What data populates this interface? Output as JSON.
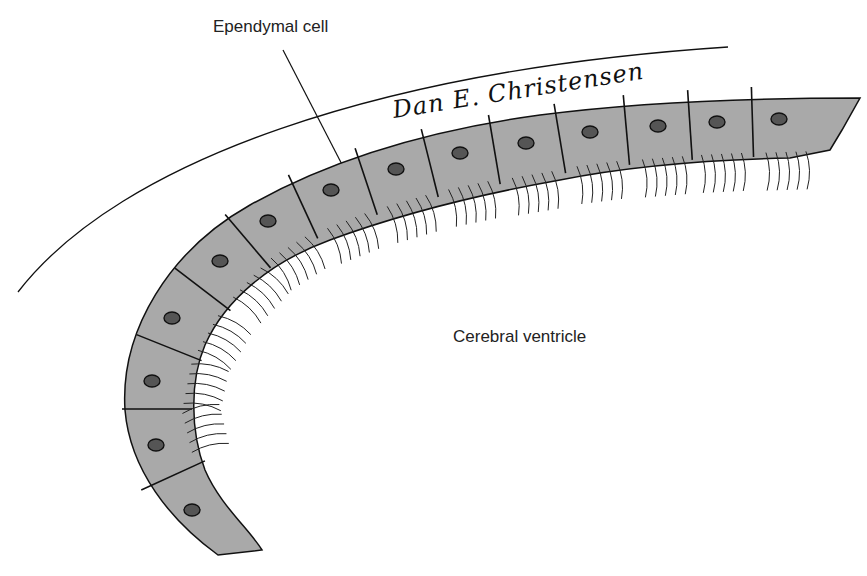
{
  "figure": {
    "labels": {
      "ependymal_cell": "Ependymal cell",
      "cerebral_ventricle": "Cerebral ventricle"
    },
    "signature": "Dan E. Christensen",
    "colors": {
      "cell_fill": "#a9a9a9",
      "outline": "#111111",
      "nucleus": "#555555",
      "background": "#ffffff"
    },
    "cells": [
      {
        "cx": 190,
        "cy": 510,
        "nx": 192,
        "ny": 510
      },
      {
        "cx": 158,
        "cy": 440,
        "nx": 156,
        "ny": 445
      },
      {
        "cx": 158,
        "cy": 378,
        "nx": 152,
        "ny": 381
      },
      {
        "cx": 182,
        "cy": 318,
        "nx": 172,
        "ny": 318
      },
      {
        "cx": 225,
        "cy": 262,
        "nx": 220,
        "ny": 261
      },
      {
        "cx": 272,
        "cy": 222,
        "nx": 268,
        "ny": 221
      },
      {
        "cx": 335,
        "cy": 193,
        "nx": 331,
        "ny": 190
      },
      {
        "cx": 398,
        "cy": 172,
        "nx": 396,
        "ny": 169
      },
      {
        "cx": 462,
        "cy": 156,
        "nx": 460,
        "ny": 153
      },
      {
        "cx": 527,
        "cy": 145,
        "nx": 526,
        "ny": 143
      },
      {
        "cx": 593,
        "cy": 134,
        "nx": 590,
        "ny": 132
      },
      {
        "cx": 660,
        "cy": 128,
        "nx": 658,
        "ny": 126
      },
      {
        "cx": 720,
        "cy": 124,
        "nx": 717,
        "ny": 122
      },
      {
        "cx": 785,
        "cy": 122,
        "nx": 779,
        "ny": 119
      }
    ]
  }
}
